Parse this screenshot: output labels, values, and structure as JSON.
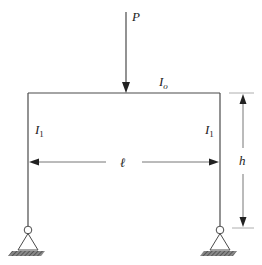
{
  "diagram": {
    "type": "portal-frame",
    "colors": {
      "line": "#4a4a4a",
      "ground": "#555555",
      "text": "#222222"
    },
    "labels": {
      "load": "P",
      "beam_inertia": {
        "base": "I",
        "sub": "o"
      },
      "left_column_inertia": {
        "base": "I",
        "sub": "1"
      },
      "right_column_inertia": {
        "base": "I",
        "sub": "1"
      },
      "span": "ℓ",
      "height": "h"
    },
    "supports": [
      "pin",
      "pin"
    ]
  }
}
